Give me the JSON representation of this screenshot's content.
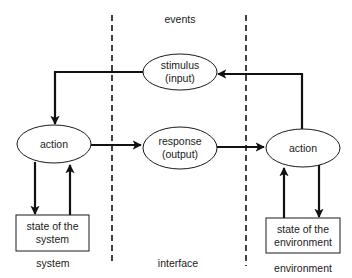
{
  "diagram": {
    "region_labels": {
      "events": "events",
      "system": "system",
      "interface": "interface",
      "environment": "environment"
    },
    "nodes": {
      "stimulus": {
        "line1": "stimulus",
        "line2": "(input)",
        "shape": "ellipse"
      },
      "response": {
        "line1": "response",
        "line2": "(output)",
        "shape": "ellipse"
      },
      "system_action": {
        "label": "action",
        "shape": "ellipse"
      },
      "environment_action": {
        "label": "action",
        "shape": "ellipse"
      },
      "system_state": {
        "line1": "state of the",
        "line2": "system",
        "shape": "rectangle"
      },
      "environment_state": {
        "line1": "state of the",
        "line2": "environment",
        "shape": "rectangle"
      }
    },
    "edges": [
      {
        "from": "environment_action",
        "to": "stimulus"
      },
      {
        "from": "stimulus",
        "to": "system_action"
      },
      {
        "from": "system_action",
        "to": "response"
      },
      {
        "from": "response",
        "to": "environment_action"
      },
      {
        "from": "system_action",
        "to": "system_state"
      },
      {
        "from": "system_state",
        "to": "system_action"
      },
      {
        "from": "environment_action",
        "to": "environment_state"
      },
      {
        "from": "environment_state",
        "to": "environment_action"
      }
    ],
    "dividers": [
      "system-interface boundary",
      "interface-environment boundary"
    ],
    "colors": {
      "stroke": "#111111",
      "fill": "#ffffff",
      "text": "#1a1a1a"
    }
  }
}
